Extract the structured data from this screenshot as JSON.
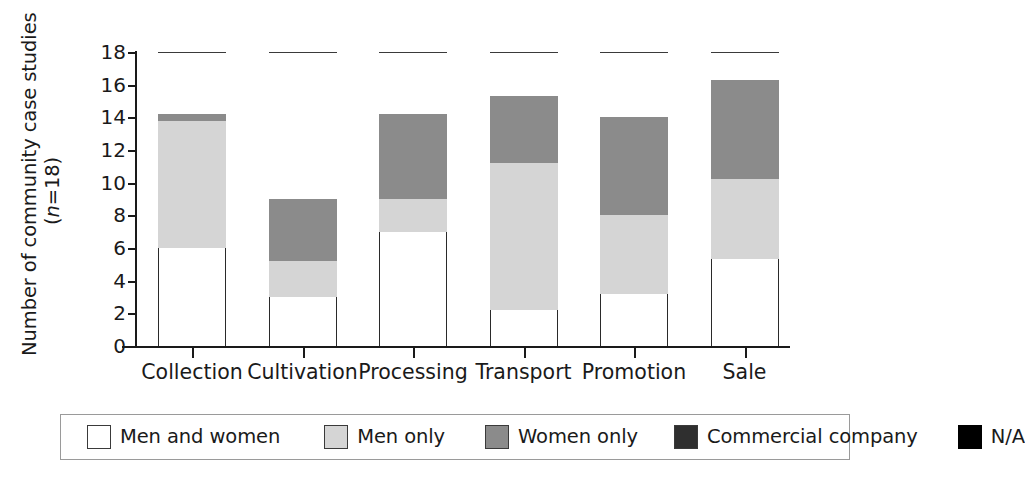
{
  "chart_data": {
    "type": "bar",
    "subtype": "stacked-bar",
    "title": "",
    "subtitle": "",
    "xlabel": "",
    "ylabel": "Number of community case studies",
    "ylabel_line2": "(n=18)",
    "ylabel_line2_italic_prefix": "n",
    "ylabel_line2_rest": "=18)",
    "grid": false,
    "legend_position": "bottom",
    "ylim": [
      0,
      18
    ],
    "yticks": [
      0,
      2,
      4,
      6,
      8,
      10,
      12,
      14,
      16,
      18
    ],
    "ytick_labels": [
      "0",
      "2",
      "4",
      "6",
      "8",
      "10",
      "12",
      "14",
      "16",
      "18"
    ],
    "categories": [
      "Collection",
      "Cultivation",
      "Processing",
      "Transport",
      "Promotion",
      "Sale"
    ],
    "series": [
      {
        "name": "Men and women",
        "color": "#ffffff",
        "values": [
          6.0,
          3.0,
          7.0,
          2.2,
          3.2,
          5.3
        ]
      },
      {
        "name": "Men only",
        "color": "#d5d5d5",
        "values": [
          7.8,
          2.2,
          2.0,
          9.0,
          4.8,
          4.9
        ]
      },
      {
        "name": "Women only",
        "color": "#8b8b8b",
        "values": [
          0.4,
          3.8,
          5.2,
          4.1,
          6.0,
          6.1
        ]
      },
      {
        "name": "Commercial company",
        "color": "#3a3a3a",
        "values": [
          0.0,
          0.0,
          0.0,
          2.3,
          2.2,
          1.7
        ]
      },
      {
        "name": "N/A",
        "color": "#000000",
        "values": [
          3.8,
          9.0,
          3.8,
          0.4,
          1.8,
          0.0
        ]
      }
    ],
    "totals": [
      18,
      18,
      18,
      18,
      18,
      18
    ],
    "annotations": []
  },
  "legend": {
    "items": [
      {
        "label": "Men and women",
        "swatch": "men-and-women"
      },
      {
        "label": "Men only",
        "swatch": "men-only"
      },
      {
        "label": "Women only",
        "swatch": "women-only"
      },
      {
        "label": "Commercial company",
        "swatch": "commercial"
      },
      {
        "label": "N/A",
        "swatch": "na"
      }
    ]
  }
}
